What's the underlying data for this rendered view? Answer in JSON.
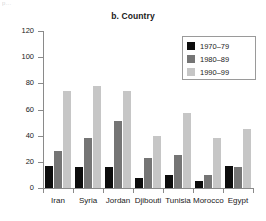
{
  "artifact": {
    "text": "p..."
  },
  "chart_data": {
    "type": "bar",
    "title": "b. Country",
    "xlabel": "",
    "ylabel": "",
    "ylim": [
      0,
      120
    ],
    "yticks": [
      0,
      20,
      40,
      60,
      80,
      100,
      120
    ],
    "grid": false,
    "legend_position": "top-right",
    "categories": [
      "Iran",
      "Syria",
      "Jordan",
      "Djibouti",
      "Tunisia",
      "Morocco",
      "Egypt"
    ],
    "series": [
      {
        "name": "1970–79",
        "color": "#0d0d0d",
        "values": [
          17,
          16,
          16,
          8,
          10,
          5,
          17
        ]
      },
      {
        "name": "1980–89",
        "color": "#757575",
        "values": [
          28,
          38,
          51,
          23,
          25,
          10,
          16
        ]
      },
      {
        "name": "1990–99",
        "color": "#c6c6c6",
        "values": [
          74,
          78,
          74,
          40,
          57,
          38,
          45
        ]
      }
    ]
  }
}
